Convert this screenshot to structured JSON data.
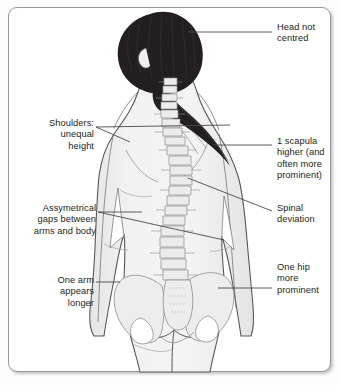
{
  "diagram": {
    "panel": {
      "background": "#ffffff",
      "border_color": "#9a9a9a",
      "shadow": true
    },
    "colors": {
      "body_fill": "#f0f0f0",
      "body_outline": "#58585a",
      "bone_fill": "#e8e8e8",
      "bone_outline": "#8d8d8f",
      "hair": "#231f20",
      "leader_line": "#4a4a4c",
      "text": "#231f20"
    }
  },
  "labels": {
    "head": {
      "text": "Head not\ncentred",
      "side": "right",
      "lines": 2
    },
    "scapula": {
      "text": "1 scapula\nhigher (and\noften more\nprominent)",
      "side": "right",
      "lines": 4
    },
    "spinal": {
      "text": "Spinal\ndeviation",
      "side": "right",
      "lines": 2
    },
    "hip": {
      "text": "One hip\nmore\nprominent",
      "side": "right",
      "lines": 3
    },
    "shoulders": {
      "text": "Shoulders:\nunequal\nheight",
      "side": "left",
      "lines": 3
    },
    "gaps": {
      "text": "Assymetrical\ngaps between\narms and body",
      "side": "left",
      "lines": 3
    },
    "arm": {
      "text": "One arm\nappears\nlonger",
      "side": "left",
      "lines": 3
    }
  }
}
